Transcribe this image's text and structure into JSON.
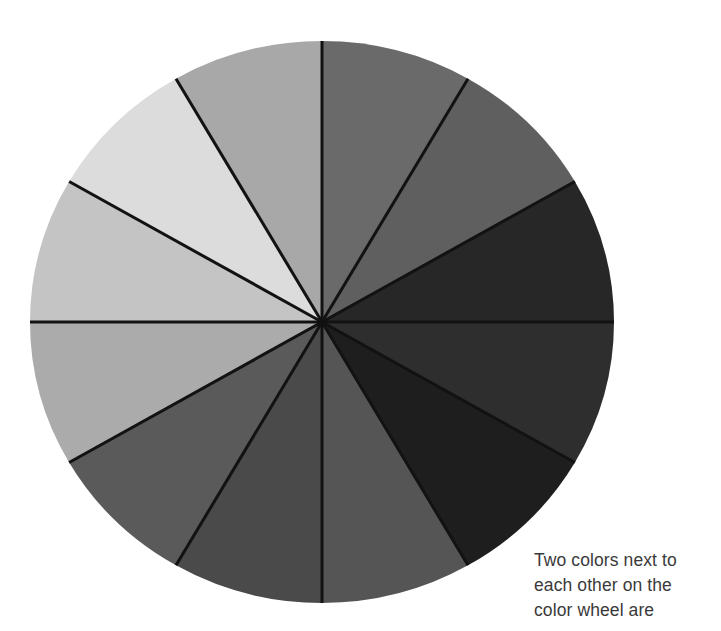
{
  "page": {
    "background_color": "#ffffff"
  },
  "figure": {
    "name": "color-wheel",
    "center_x": 322,
    "center_y": 322,
    "radius_x": 292,
    "radius_y": 281,
    "segment_count": 12,
    "segment_angle_degrees": 30,
    "divider_color": "#121212",
    "divider_width": 3
  },
  "caption": {
    "text_color": "#3a3a3a",
    "lines": [
      "Two colors next to",
      "each other on the",
      "color wheel are"
    ]
  },
  "chart_data": {
    "type": "pie",
    "title": "",
    "xlabel": "",
    "ylabel": "",
    "legend_position": "none",
    "grid": false,
    "categories": [
      "segment-01",
      "segment-02",
      "segment-03",
      "segment-04",
      "segment-05",
      "segment-06",
      "segment-07",
      "segment-08",
      "segment-09",
      "segment-10",
      "segment-11",
      "segment-12"
    ],
    "values": [
      8.333,
      8.333,
      8.333,
      8.333,
      8.333,
      8.333,
      8.333,
      8.333,
      8.333,
      8.333,
      8.333,
      8.333
    ],
    "colors": [
      "#6a6a6a",
      "#5f5f5f",
      "#272727",
      "#2e2e2e",
      "#1e1e1e",
      "#555555",
      "#4a4a4a",
      "#5a5a5a",
      "#ababab",
      "#c4c4c4",
      "#dcdcdc",
      "#a8a8a8"
    ],
    "start_angle_degrees": -90,
    "segments": [
      {
        "label": "segment-01",
        "color": "#6a6a6a",
        "start_deg": -90,
        "end_deg": -60
      },
      {
        "label": "segment-02",
        "color": "#5f5f5f",
        "start_deg": -60,
        "end_deg": -30
      },
      {
        "label": "segment-03",
        "color": "#272727",
        "start_deg": -30,
        "end_deg": 0
      },
      {
        "label": "segment-04",
        "color": "#2e2e2e",
        "start_deg": 0,
        "end_deg": 30
      },
      {
        "label": "segment-05",
        "color": "#1e1e1e",
        "start_deg": 30,
        "end_deg": 60
      },
      {
        "label": "segment-06",
        "color": "#555555",
        "start_deg": 60,
        "end_deg": 90
      },
      {
        "label": "segment-07",
        "color": "#4a4a4a",
        "start_deg": 90,
        "end_deg": 120
      },
      {
        "label": "segment-08",
        "color": "#5a5a5a",
        "start_deg": 120,
        "end_deg": 150
      },
      {
        "label": "segment-09",
        "color": "#ababab",
        "start_deg": 150,
        "end_deg": 180
      },
      {
        "label": "segment-10",
        "color": "#c4c4c4",
        "start_deg": 180,
        "end_deg": 210
      },
      {
        "label": "segment-11",
        "color": "#dcdcdc",
        "start_deg": 210,
        "end_deg": 240
      },
      {
        "label": "segment-12",
        "color": "#a8a8a8",
        "start_deg": 240,
        "end_deg": 270
      }
    ]
  }
}
